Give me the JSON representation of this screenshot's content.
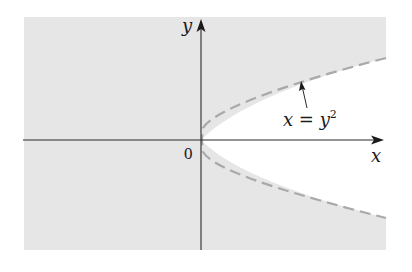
{
  "figure": {
    "axes": {
      "x_label": "x",
      "y_label": "y",
      "origin_label": "0"
    },
    "curve": {
      "equation_lhs": "x = y",
      "equation_exp": "2",
      "style": "dashed",
      "color": "#a9a9a9"
    },
    "region": {
      "description": "shaded region x < y^2 (outside the parabola)",
      "fill_color": "#e6e6e6"
    },
    "colors": {
      "axis": "#2b2b2b",
      "background": "#ffffff"
    }
  }
}
